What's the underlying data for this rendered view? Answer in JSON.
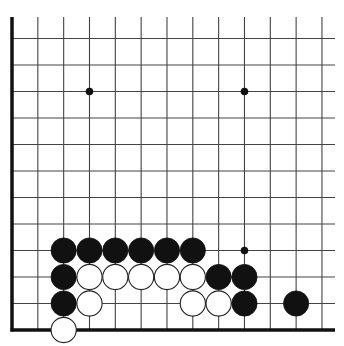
{
  "diagram": {
    "type": "go-board-corner",
    "orientation": "bottom-left corner",
    "grid": {
      "columns": 13,
      "rows": 12,
      "x0": 12,
      "dx": 25.83,
      "y_bottom": 330,
      "dy": 26.5,
      "line_color": "#444444",
      "edge_color": "#111111",
      "top_open_y": 17,
      "right_open_x": 335
    },
    "star_points": [
      {
        "col": 3,
        "row": 9
      },
      {
        "col": 9,
        "row": 9
      },
      {
        "col": 9,
        "row": 3
      }
    ],
    "stones": [
      {
        "color": "black",
        "col": 2,
        "row": 3
      },
      {
        "color": "black",
        "col": 3,
        "row": 3
      },
      {
        "color": "black",
        "col": 4,
        "row": 3
      },
      {
        "color": "black",
        "col": 5,
        "row": 3
      },
      {
        "color": "black",
        "col": 6,
        "row": 3
      },
      {
        "color": "black",
        "col": 7,
        "row": 3
      },
      {
        "color": "black",
        "col": 2,
        "row": 2
      },
      {
        "color": "white",
        "col": 3,
        "row": 2
      },
      {
        "color": "white",
        "col": 4,
        "row": 2
      },
      {
        "color": "white",
        "col": 5,
        "row": 2
      },
      {
        "color": "white",
        "col": 6,
        "row": 2
      },
      {
        "color": "white",
        "col": 7,
        "row": 2
      },
      {
        "color": "black",
        "col": 8,
        "row": 2
      },
      {
        "color": "black",
        "col": 9,
        "row": 2
      },
      {
        "color": "black",
        "col": 2,
        "row": 1
      },
      {
        "color": "white",
        "col": 3,
        "row": 1
      },
      {
        "color": "white",
        "col": 7,
        "row": 1
      },
      {
        "color": "white",
        "col": 8,
        "row": 1
      },
      {
        "color": "black",
        "col": 9,
        "row": 1
      },
      {
        "color": "black",
        "col": 11,
        "row": 1
      },
      {
        "color": "white",
        "col": 2,
        "row": 0
      }
    ],
    "colors": {
      "black_stone": "#111111",
      "white_stone": "#ffffff",
      "white_stone_outline": "#222222",
      "background": "#ffffff"
    }
  }
}
